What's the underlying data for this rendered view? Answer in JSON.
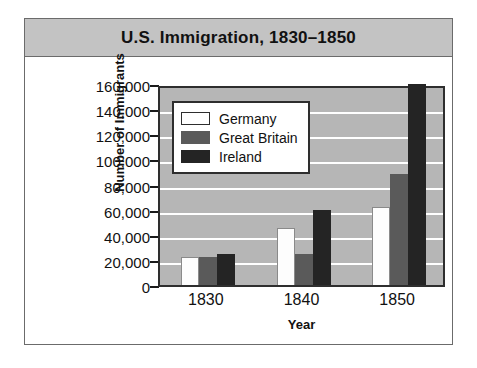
{
  "figure": {
    "title": "U.S. Immigration, 1830–1850"
  },
  "chart_data": {
    "type": "bar",
    "title": "U.S. Immigration, 1830–1850",
    "xlabel": "Year",
    "ylabel": "Number of Immigrants",
    "categories": [
      "1830",
      "1840",
      "1850"
    ],
    "series": [
      {
        "name": "Germany",
        "color": "#ffffff",
        "values": [
          22000,
          45000,
          62000
        ]
      },
      {
        "name": "Great Britain",
        "color": "#5a5a5a",
        "values": [
          22000,
          25000,
          88000
        ]
      },
      {
        "name": "Ireland",
        "color": "#242424",
        "values": [
          25000,
          60000,
          165000
        ]
      }
    ],
    "ylim": [
      0,
      160000
    ],
    "ytick_values": [
      0,
      20000,
      40000,
      60000,
      80000,
      100000,
      120000,
      140000,
      160000
    ],
    "ytick_labels": [
      "0",
      "20,000",
      "40,000",
      "60,000",
      "80,000",
      "100,000",
      "120,000",
      "140,000",
      "160,000"
    ],
    "grid": true,
    "legend_position": "upper-left-inside"
  }
}
